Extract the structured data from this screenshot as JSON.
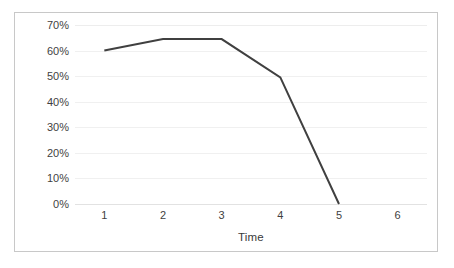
{
  "chart_data": {
    "type": "line",
    "title": "",
    "xlabel": "Time",
    "ylabel": "Function",
    "categories": [
      "1",
      "2",
      "3",
      "4",
      "5",
      "6"
    ],
    "x": [
      1,
      2,
      3,
      4,
      5,
      6
    ],
    "values": [
      60,
      64.5,
      64.5,
      49.5,
      0,
      null
    ],
    "value_suffix": "%",
    "ylim": [
      0,
      70
    ],
    "ytick_values": [
      0,
      10,
      20,
      30,
      40,
      50,
      60,
      70
    ],
    "ytick_labels": [
      "0%",
      "10%",
      "20%",
      "30%",
      "40%",
      "50%",
      "60%",
      "70%"
    ],
    "grid": true,
    "grid_axis": "y",
    "legend": false,
    "legend_position": "none",
    "markers": false,
    "series": [
      {
        "name": "Function",
        "values": [
          60,
          64.5,
          64.5,
          49.5,
          0,
          null
        ],
        "color": "#404040",
        "line_width": 2
      }
    ]
  },
  "style": {
    "border_color": "#c8c8c8",
    "gridline_color": "#f0f0f0",
    "baseline_color": "#e2e2e2",
    "plot_background": "#ffffff",
    "tick_label_color": "#3f3f3f",
    "axis_title_color": "#3a3a3a"
  }
}
